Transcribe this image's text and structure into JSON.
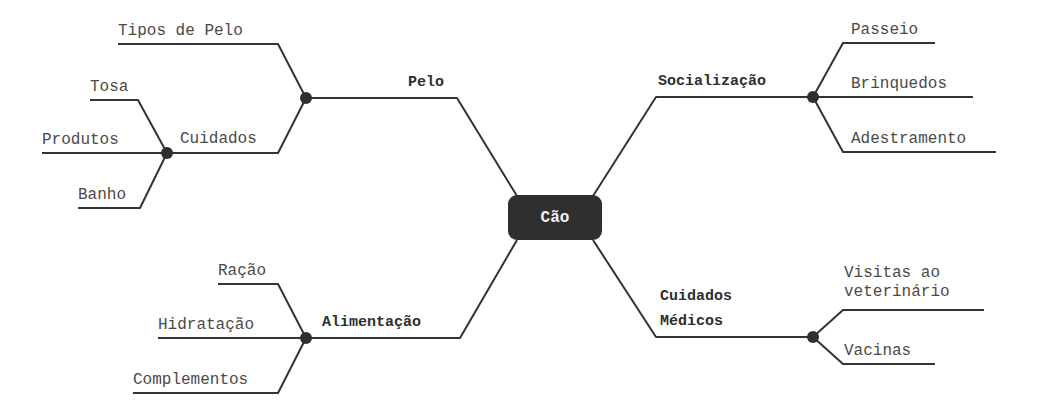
{
  "mindmap": {
    "center": "Cão",
    "branches": {
      "pelo": {
        "label": "Pelo",
        "children": {
          "tipos": "Tipos de Pelo",
          "cuidados": {
            "label": "Cuidados",
            "children": [
              "Tosa",
              "Produtos",
              "Banho"
            ]
          }
        }
      },
      "socializacao": {
        "label": "Socialização",
        "children": [
          "Passeio",
          "Brinquedos",
          "Adestramento"
        ]
      },
      "alimentacao": {
        "label": "Alimentação",
        "children": [
          "Ração",
          "Hidratação",
          "Complementos"
        ]
      },
      "cuidados_medicos": {
        "label_line1": "Cuidados",
        "label_line2": "Médicos",
        "children": {
          "visitas_line1": "Visitas ao",
          "visitas_line2": "veterinário",
          "vacinas": "Vacinas"
        }
      }
    }
  },
  "colors": {
    "line": "#333333",
    "node": "#2f2f2f",
    "center_bg": "#2f2f2f",
    "center_text": "#f2f2f2",
    "leaf_text": "#4a4a4a"
  }
}
